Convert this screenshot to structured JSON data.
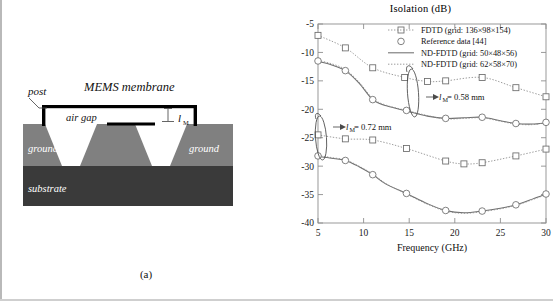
{
  "figure": {
    "panel_a_caption": "(a)",
    "panel_b_caption": "(b)"
  },
  "diagram": {
    "labels": {
      "post": "post",
      "membrane": "MEMS membrane",
      "air_gap": "air gap",
      "lm": "l",
      "lm_sub": "M",
      "ground_left": "ground",
      "ground_right": "ground",
      "substrate": "substrate"
    },
    "colors": {
      "ground_fill": "#808080",
      "substrate_fill": "#3a3a3a",
      "metal": "#000000",
      "air": "#ffffff"
    }
  },
  "chart_data": {
    "type": "line",
    "title": "Isolation (dB)",
    "xlabel": "Frequency (GHz)",
    "ylabel": "",
    "xlim": [
      5,
      30
    ],
    "ylim": [
      -40,
      -5
    ],
    "xticks": [
      5,
      10,
      15,
      20,
      25,
      30
    ],
    "yticks": [
      -5,
      -10,
      -15,
      -20,
      -25,
      -30,
      -35,
      -40
    ],
    "xtick_labels": [
      "5",
      "10",
      "15",
      "20",
      "25",
      "30"
    ],
    "ytick_labels": [
      "-5",
      "-10",
      "-15",
      "-20",
      "-25",
      "-30",
      "-35",
      "-40"
    ],
    "grid": false,
    "legend_position": "top-right",
    "legend": [
      {
        "label": "FDTD (grid: 136×98×154)",
        "marker": "square",
        "line": "dotted"
      },
      {
        "label": "Reference data [44]",
        "marker": "circle",
        "line": "none"
      },
      {
        "label": "ND-FDTD (grid: 50×48×56)",
        "marker": "none",
        "line": "solid"
      },
      {
        "label": "ND-FDTD (grid: 62×58×70)",
        "marker": "none",
        "line": "dotted"
      }
    ],
    "annotations": [
      {
        "text": "l",
        "sub": "M",
        "rest": " = 0.58 mm",
        "group": "upper"
      },
      {
        "text": "l",
        "sub": "M",
        "rest": " = 0.72 mm",
        "group": "lower"
      }
    ],
    "series": [
      {
        "name": "FDTD (grid: 136×98×154) — lM = 0.58 mm",
        "group": "upper",
        "style": "dotted",
        "marker": "square",
        "x": [
          5,
          8,
          11,
          14.5,
          17,
          19,
          23,
          26.7,
          30
        ],
        "values": [
          -7.0,
          -9.2,
          -12.7,
          -14.4,
          -15.1,
          -15.0,
          -14.4,
          -16.2,
          -17.8
        ]
      },
      {
        "name": "Reference data [44] — lM = 0.58 mm",
        "group": "upper",
        "style": "none",
        "marker": "circle",
        "x": [
          5,
          8,
          11,
          14.7,
          19,
          23,
          26.7,
          30
        ],
        "values": [
          -11.5,
          -13.2,
          -18.3,
          -20.2,
          -21.6,
          -21.4,
          -22.5,
          -22.3
        ]
      },
      {
        "name": "ND-FDTD (grid: 50×48×56) — lM = 0.58 mm",
        "group": "upper",
        "style": "solid",
        "marker": "none",
        "x": [
          5,
          6.5,
          8,
          9.5,
          11,
          12.5,
          14.7,
          17,
          19,
          21,
          23,
          25,
          26.7,
          28.5,
          30
        ],
        "values": [
          -11.6,
          -12.2,
          -13.2,
          -15.4,
          -18.3,
          -19.4,
          -20.3,
          -21.2,
          -21.6,
          -21.5,
          -21.4,
          -22.0,
          -22.5,
          -22.6,
          -22.4
        ]
      },
      {
        "name": "ND-FDTD (grid: 62×58×70) — lM = 0.58 mm",
        "group": "upper",
        "style": "dotted",
        "marker": "none",
        "x": [
          5,
          6.5,
          8,
          9.5,
          11,
          12.5,
          14.7,
          17,
          19,
          21,
          23,
          25,
          26.7,
          28.5,
          30
        ],
        "values": [
          -11.4,
          -12.0,
          -13.0,
          -15.2,
          -18.1,
          -19.3,
          -20.2,
          -21.1,
          -21.7,
          -21.6,
          -21.5,
          -22.1,
          -22.6,
          -22.7,
          -22.3
        ]
      },
      {
        "name": "FDTD (grid: 136×98×154) — lM = 0.72 mm",
        "group": "lower",
        "style": "dotted",
        "marker": "square",
        "x": [
          5,
          8,
          11,
          14.7,
          19,
          21,
          23,
          26.7,
          30
        ],
        "values": [
          -24.5,
          -25.2,
          -25.4,
          -26.9,
          -29.1,
          -29.6,
          -29.4,
          -28.2,
          -27.0
        ]
      },
      {
        "name": "Reference data [44] — lM = 0.72 mm",
        "group": "lower",
        "style": "none",
        "marker": "circle",
        "x": [
          5,
          8,
          11,
          14.7,
          19,
          23,
          26.7,
          30
        ],
        "values": [
          -28.2,
          -29.0,
          -31.5,
          -34.8,
          -37.8,
          -37.9,
          -36.8,
          -34.9
        ]
      },
      {
        "name": "ND-FDTD (grid: 50×48×56) — lM = 0.72 mm",
        "group": "lower",
        "style": "solid",
        "marker": "none",
        "x": [
          5,
          6.5,
          8,
          9.5,
          11,
          12.5,
          14.7,
          17,
          19,
          21,
          23,
          25,
          26.7,
          28.5,
          30
        ],
        "values": [
          -28.3,
          -28.6,
          -29.0,
          -30.1,
          -31.5,
          -33.2,
          -34.8,
          -36.6,
          -37.8,
          -38.2,
          -37.9,
          -37.4,
          -36.8,
          -35.8,
          -34.9
        ]
      },
      {
        "name": "ND-FDTD (grid: 62×58×70) — lM = 0.72 mm",
        "group": "lower",
        "style": "dotted",
        "marker": "none",
        "x": [
          5,
          6.5,
          8,
          9.5,
          11,
          12.5,
          14.7,
          17,
          19,
          21,
          23,
          25,
          26.7,
          28.5,
          30
        ],
        "values": [
          -28.1,
          -28.5,
          -28.9,
          -30.0,
          -31.4,
          -33.1,
          -34.9,
          -36.7,
          -37.9,
          -38.3,
          -38.0,
          -37.5,
          -36.9,
          -35.9,
          -35.0
        ]
      }
    ]
  }
}
